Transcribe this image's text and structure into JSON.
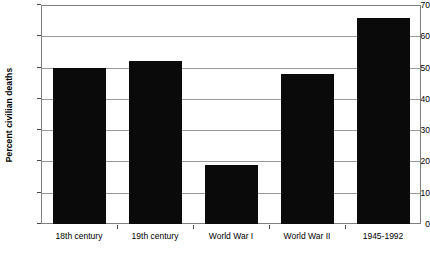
{
  "chart_data": {
    "type": "bar",
    "title": "",
    "subtitle": "",
    "xlabel": "",
    "ylabel": "Percent civilian deaths",
    "categories": [
      "18th century",
      "19th century",
      "World War I",
      "World War II",
      "1945-1992"
    ],
    "values": [
      50,
      52,
      19,
      48,
      66
    ],
    "ylim": [
      0,
      70
    ],
    "ytick_values": [
      0,
      10,
      20,
      30,
      40,
      50,
      60,
      70
    ],
    "ytick_labels": [
      "0",
      "10",
      "20",
      "30",
      "40",
      "50",
      "60",
      "70"
    ],
    "grid": "horizontal",
    "legend": "none",
    "bar_color": "#0a0a0a",
    "gridline_color": "#9a9a9a",
    "frame_color": "#808080",
    "background_color": "#ffffff",
    "text_color": "#000000"
  }
}
